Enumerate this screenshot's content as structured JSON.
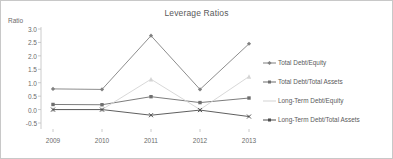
{
  "chart_data": {
    "type": "line",
    "title": "Leverage Ratios",
    "xlabel": "",
    "ylabel": "Ratio",
    "categories": [
      "2009",
      "2010",
      "2011",
      "2012",
      "2013"
    ],
    "ylim": [
      -0.5,
      3.0
    ],
    "yticks": [
      3.0,
      2.5,
      2.0,
      1.5,
      1.0,
      0.5,
      0.0,
      -0.5
    ],
    "ytick_labels": [
      "3.0",
      "2.5",
      "2.0",
      "1.5",
      "1.0",
      "0.5",
      "0.0",
      "-0.5"
    ],
    "grid": false,
    "legend_position": "right",
    "series": [
      {
        "name": "Total Debt/Equity",
        "values": [
          0.77,
          0.75,
          2.75,
          0.75,
          2.45
        ],
        "color": "#808080",
        "marker": "diamond"
      },
      {
        "name": "Total Debt/Total Assets",
        "values": [
          0.19,
          0.18,
          0.48,
          0.26,
          0.43
        ],
        "color": "#6e6e6e",
        "marker": "square"
      },
      {
        "name": "Long-Term Debt/Equity",
        "values": [
          0.0,
          0.0,
          1.13,
          0.0,
          1.23
        ],
        "color": "#d4d4d4",
        "marker": "triangle"
      },
      {
        "name": "Long-Term Debt/Total Assets",
        "values": [
          0.0,
          0.0,
          -0.21,
          -0.02,
          -0.26
        ],
        "color": "#4d4d4d",
        "marker": "cross"
      }
    ]
  },
  "figure": {
    "border_color": "#c8c8c8",
    "background": "#ffffff",
    "axis_color": "#bfbfbf"
  }
}
